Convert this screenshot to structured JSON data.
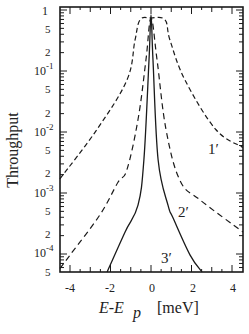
{
  "chart_data": {
    "type": "line",
    "title": "",
    "xlabel": "E-E_p [meV]",
    "ylabel": "Throughput",
    "xlim": [
      -4.5,
      4.55
    ],
    "ylim": [
      4.7e-05,
      1.05
    ],
    "yscale": "log",
    "grid": false,
    "legend": "inline curve labels",
    "x_ticks": [
      -4,
      -2,
      0,
      2,
      4
    ],
    "x_tick_labels": [
      "-4",
      "-2",
      "0",
      "2",
      "4"
    ],
    "y_ticks": [
      1,
      0.5,
      0.2,
      0.1,
      0.05,
      0.02,
      0.01,
      0.005,
      0.002,
      0.001,
      0.0005,
      0.0002,
      0.0001,
      5e-05
    ],
    "y_tick_labels": [
      "1",
      "5",
      "2",
      "10^-1",
      "5",
      "2",
      "10^-2",
      "5",
      "2",
      "10^-3",
      "5",
      "2",
      "10^-4",
      "5"
    ],
    "series": [
      {
        "name": "1′",
        "style": "long-dash",
        "x": [
          -4.5,
          -2.67,
          -1.19,
          -0.79,
          -0.54,
          0,
          0.69,
          0.94,
          1.68,
          3.2,
          4.54
        ],
        "y": [
          0.0017,
          0.011,
          0.071,
          0.32,
          0.69,
          0.74,
          0.69,
          0.32,
          0.071,
          0.011,
          0.0056
        ]
      },
      {
        "name": "2′",
        "style": "dash",
        "x": [
          -4.5,
          -4.0,
          -2.52,
          -1.63,
          -1.19,
          -0.64,
          -0.25,
          0,
          0.3,
          0.74,
          1.43,
          2.42,
          4.54
        ],
        "y": [
          5.8e-05,
          9.6e-05,
          0.00044,
          0.0015,
          0.0024,
          0.016,
          0.15,
          0.74,
          0.15,
          0.011,
          0.0016,
          0.00077,
          0.00023
        ]
      },
      {
        "name": "3′",
        "style": "solid",
        "x": [
          -2.17,
          -1.28,
          -0.64,
          -0.35,
          -0.1,
          0,
          0.1,
          0.35,
          0.84,
          1.09,
          1.93,
          2.52
        ],
        "y": [
          5e-05,
          0.00023,
          0.00063,
          0.0035,
          0.15,
          0.83,
          0.15,
          0.0035,
          0.00063,
          0.00039,
          9.6e-05,
          5e-05
        ]
      }
    ],
    "annotations": [
      {
        "text": "1′",
        "x": 3.2,
        "y": 0.0095
      },
      {
        "text": "2′",
        "x": 1.68,
        "y": 0.0006
      },
      {
        "text": "3′",
        "x": 0.79,
        "y": 6e-05
      }
    ]
  },
  "labels": {
    "y_axis_title": "Throughput",
    "x_axis_title_main": "E-E",
    "x_axis_title_sub": "p",
    "x_axis_unit": "[meV]",
    "curve_1": "1′",
    "curve_2": "2′",
    "curve_3": "3′",
    "decade_exp": [
      "-1",
      "-2",
      "-3",
      "-4"
    ]
  }
}
